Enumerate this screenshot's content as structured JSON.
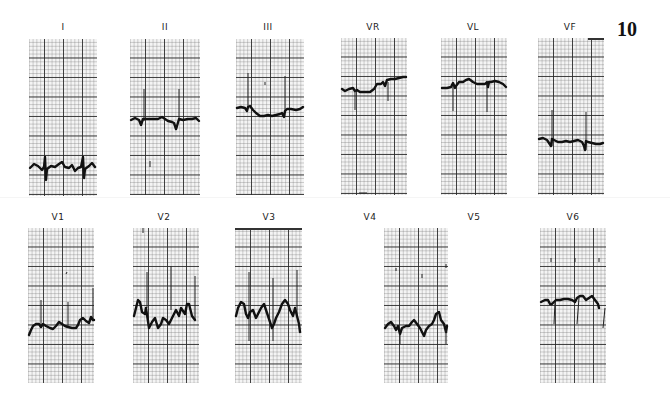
{
  "page": {
    "number": "10"
  },
  "leads": {
    "I": {
      "label": "I"
    },
    "II": {
      "label": "II"
    },
    "III": {
      "label": "III"
    },
    "VR": {
      "label": "VR"
    },
    "VL": {
      "label": "VL"
    },
    "VF": {
      "label": "VF"
    },
    "V1": {
      "label": "V1"
    },
    "V2": {
      "label": "V2"
    },
    "V3": {
      "label": "V3"
    },
    "V4": {
      "label": "V4"
    },
    "V5": {
      "label": "V5"
    },
    "V6": {
      "label": "V6"
    }
  },
  "colors": {
    "trace": "#111111",
    "grid_major": "#2a2a2a",
    "grid_minor": "#9a9a9a",
    "paper": "#f4f4f4"
  }
}
